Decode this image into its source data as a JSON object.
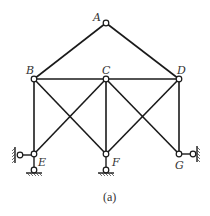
{
  "figure": {
    "caption": "(a)",
    "labels": {
      "A": "A",
      "B": "B",
      "C": "C",
      "D": "D",
      "E": "E",
      "F": "F",
      "G": "G"
    },
    "nodes": [
      {
        "id": "A",
        "x": 106,
        "y": 23
      },
      {
        "id": "B",
        "x": 34,
        "y": 79
      },
      {
        "id": "C",
        "x": 106,
        "y": 79
      },
      {
        "id": "D",
        "x": 179,
        "y": 79
      },
      {
        "id": "E",
        "x": 34,
        "y": 154
      },
      {
        "id": "F",
        "x": 106,
        "y": 154
      },
      {
        "id": "G",
        "x": 179,
        "y": 154
      }
    ],
    "members": [
      [
        "A",
        "B"
      ],
      [
        "A",
        "D"
      ],
      [
        "B",
        "C"
      ],
      [
        "C",
        "D"
      ],
      [
        "B",
        "E"
      ],
      [
        "C",
        "F"
      ],
      [
        "D",
        "G"
      ],
      [
        "B",
        "F"
      ],
      [
        "C",
        "E"
      ],
      [
        "C",
        "G"
      ],
      [
        "D",
        "F"
      ]
    ],
    "supports": [
      {
        "node": "E",
        "type": "horizontal-link",
        "side": "left"
      },
      {
        "node": "E",
        "type": "vertical-link",
        "side": "bottom"
      },
      {
        "node": "F",
        "type": "vertical-link",
        "side": "bottom"
      },
      {
        "node": "G",
        "type": "horizontal-link",
        "side": "right"
      }
    ],
    "colors": {
      "line": "#1a1a1a",
      "label": "#333333",
      "background": "#ffffff"
    }
  }
}
